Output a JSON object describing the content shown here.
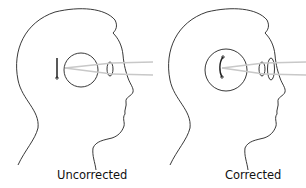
{
  "diagram": {
    "panels": [
      {
        "label": "Uncorrected",
        "image_focus": "behind retina (focal point outside eye)",
        "lenses": [
          "eye lens"
        ]
      },
      {
        "label": "Corrected",
        "image_focus": "on retina",
        "lenses": [
          "eye lens",
          "corrective lens"
        ]
      }
    ],
    "colors": {
      "outline": "#222222",
      "light_rays": "#c8c8c8",
      "background": "#ffffff"
    }
  }
}
